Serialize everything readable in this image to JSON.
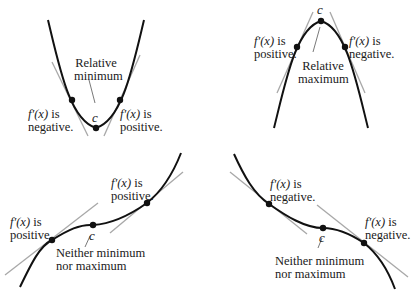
{
  "panels": [
    {
      "id": "relative-minimum",
      "left_label": {
        "fx": "f′(x)",
        "line1_suffix": " is",
        "line2": "negative."
      },
      "right_label": {
        "fx": "f′(x)",
        "line1_suffix": " is",
        "line2": "positive."
      },
      "title": {
        "line1": "Relative",
        "line2": "minimum"
      },
      "point_label": "c"
    },
    {
      "id": "relative-maximum",
      "left_label": {
        "fx": "f′(x)",
        "line1_suffix": " is",
        "line2": "positive."
      },
      "right_label": {
        "fx": "f′(x)",
        "line1_suffix": " is",
        "line2": "negative."
      },
      "title": {
        "line1": "Relative",
        "line2": "maximum"
      },
      "point_label": "c"
    },
    {
      "id": "increasing-neither",
      "left_label": {
        "fx": "f′(x)",
        "line1_suffix": " is",
        "line2": "positive."
      },
      "right_label": {
        "fx": "f′(x)",
        "line1_suffix": " is",
        "line2": "positive."
      },
      "title": {
        "line1": "Neither minimum",
        "line2": "nor maximum"
      },
      "point_label": "c"
    },
    {
      "id": "decreasing-neither",
      "left_label": {
        "fx": "f′(x)",
        "line1_suffix": " is",
        "line2": "negative."
      },
      "right_label": {
        "fx": "f′(x)",
        "line1_suffix": " is",
        "line2": "negative."
      },
      "title": {
        "line1": "Neither minimum",
        "line2": "nor maximum"
      },
      "point_label": "c"
    }
  ],
  "colors": {
    "curve": "#111111",
    "tangent": "#a8a8a8",
    "dot": "#111111",
    "leader": "#555555"
  }
}
